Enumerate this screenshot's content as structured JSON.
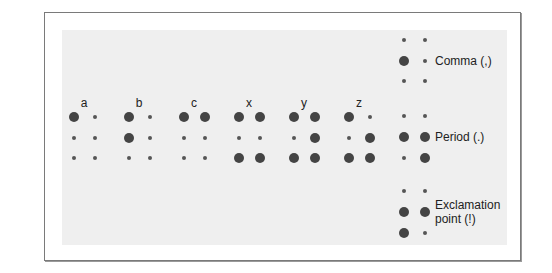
{
  "diagram": {
    "colors": {
      "panel": "#efefef",
      "frame_border": "#7a7a7a",
      "dot": "#444444",
      "text": "#222222"
    },
    "letters": [
      {
        "label": "a",
        "raised_dots": [
          1
        ]
      },
      {
        "label": "b",
        "raised_dots": [
          1,
          2
        ]
      },
      {
        "label": "c",
        "raised_dots": [
          1,
          4
        ]
      },
      {
        "label": "x",
        "raised_dots": [
          1,
          3,
          4,
          6
        ]
      },
      {
        "label": "y",
        "raised_dots": [
          1,
          3,
          4,
          5,
          6
        ]
      },
      {
        "label": "z",
        "raised_dots": [
          1,
          3,
          5,
          6
        ]
      }
    ],
    "punctuation": [
      {
        "label": "Comma (,)",
        "raised_dots": [
          2
        ]
      },
      {
        "label": "Period (.)",
        "raised_dots": [
          2,
          5,
          6
        ]
      },
      {
        "label_line1": "Exclamation",
        "label_line2": "point  (!)",
        "raised_dots": [
          2,
          3,
          5
        ]
      }
    ]
  }
}
